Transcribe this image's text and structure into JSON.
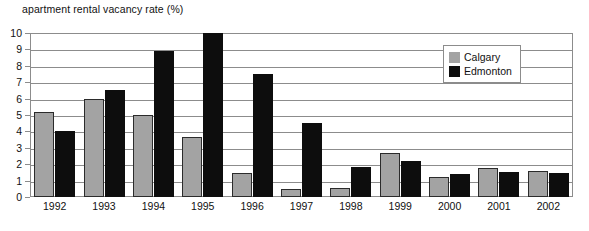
{
  "chart_data": {
    "type": "bar",
    "title": "apartment rental vacancy rate (%)",
    "xlabel": "",
    "ylabel": "",
    "ylim": [
      0,
      10
    ],
    "ytick_step": 1,
    "yticks": [
      "0",
      "1",
      "2",
      "3",
      "4",
      "5",
      "6",
      "7",
      "8",
      "9",
      "10"
    ],
    "grid": true,
    "legend_position": "top-right",
    "categories": [
      "1992",
      "1993",
      "1994",
      "1995",
      "1996",
      "1997",
      "1998",
      "1999",
      "2000",
      "2001",
      "2002"
    ],
    "series": [
      {
        "name": "Calgary",
        "color": "#a3a3a3",
        "values": [
          5.2,
          6.0,
          5.0,
          3.65,
          1.45,
          0.5,
          0.55,
          2.7,
          1.2,
          1.75,
          1.6
        ]
      },
      {
        "name": "Edmonton",
        "color": "#0d0d0d",
        "values": [
          4.0,
          6.5,
          8.9,
          10.0,
          7.5,
          4.5,
          1.85,
          2.2,
          1.4,
          1.5,
          1.45
        ]
      }
    ]
  },
  "legend": {
    "items": [
      {
        "label": "Calgary",
        "swatch": "calgary"
      },
      {
        "label": "Edmonton",
        "swatch": "edmonton"
      }
    ]
  }
}
